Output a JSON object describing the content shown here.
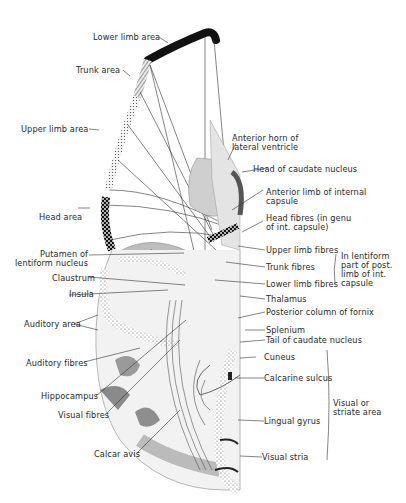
{
  "figure": {
    "type": "anatomical-diagram"
  },
  "labels": {
    "cortex": {
      "lower_limb_area": "Lower limb area",
      "trunk_area": "Trunk area",
      "upper_limb_area": "Upper limb area",
      "head_area": "Head area"
    },
    "left": {
      "putamen": "Putamen of\nlentiform nucleus",
      "claustrum": "Claustrum",
      "insula": "Insula",
      "auditory_area": "Auditory area",
      "auditory_fibres": "Auditory fibres",
      "hippocampus": "Hippocampus",
      "visual_fibres": "Visual fibres",
      "calcar_avis": "Calcar avis"
    },
    "right": {
      "anterior_horn": "Anterior horn of\nlateral ventricle",
      "head_caudate": "Head of caudate nucleus",
      "anterior_limb": "Anterior limb of internal\ncapsule",
      "head_fibres": "Head fibres (in genu\nof int. capsule)",
      "upper_limb_fibres": "Upper limb fibres",
      "trunk_fibres": "Trunk fibres",
      "lower_limb_fibres": "Lower limb fibres",
      "lentiform_group": "In lentiform\npart of post.\nlimb of int.\ncapsule",
      "thalamus": "Thalamus",
      "posterior_fornix": "Posterior column of fornix",
      "splenium": "Splenium",
      "tail_caudate": "Tail of caudate nucleus",
      "cuneus": "Cuneus",
      "calcarine_sulcus": "Calcarine sulcus",
      "lingual_gyrus": "Lingual gyrus",
      "visual_stria": "Visual stria",
      "visual_area_group": "Visual or\nstriate area"
    }
  },
  "colors": {
    "ink": "#2a2a2a",
    "grey_dark": "#6e6e6e",
    "grey_mid": "#a8a8a8",
    "grey_light": "#d9d9d9",
    "background": "#ffffff"
  }
}
